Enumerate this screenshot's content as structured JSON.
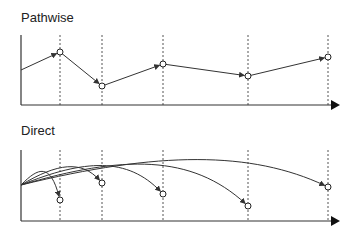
{
  "panels": [
    {
      "title": "Pathwise",
      "origin": [
        21,
        105
      ],
      "y_top": 35,
      "x_end": 340,
      "checkpoints_x": [
        60,
        102,
        163,
        248,
        328
      ],
      "start": [
        21,
        70
      ],
      "points": [
        [
          60,
          52
        ],
        [
          102,
          86
        ],
        [
          163,
          64
        ],
        [
          248,
          76
        ],
        [
          328,
          57
        ]
      ],
      "style": "chain"
    },
    {
      "title": "Direct",
      "origin": [
        21,
        221
      ],
      "y_top": 150,
      "x_end": 340,
      "checkpoints_x": [
        60,
        102,
        163,
        248,
        328
      ],
      "start": [
        21,
        185
      ],
      "points": [
        [
          60,
          200
        ],
        [
          102,
          183
        ],
        [
          163,
          194
        ],
        [
          248,
          206
        ],
        [
          328,
          187
        ]
      ],
      "style": "fan"
    }
  ],
  "colors": {
    "line": "#333333",
    "dashed": "#555555",
    "marker_fill": "#ffffff"
  }
}
